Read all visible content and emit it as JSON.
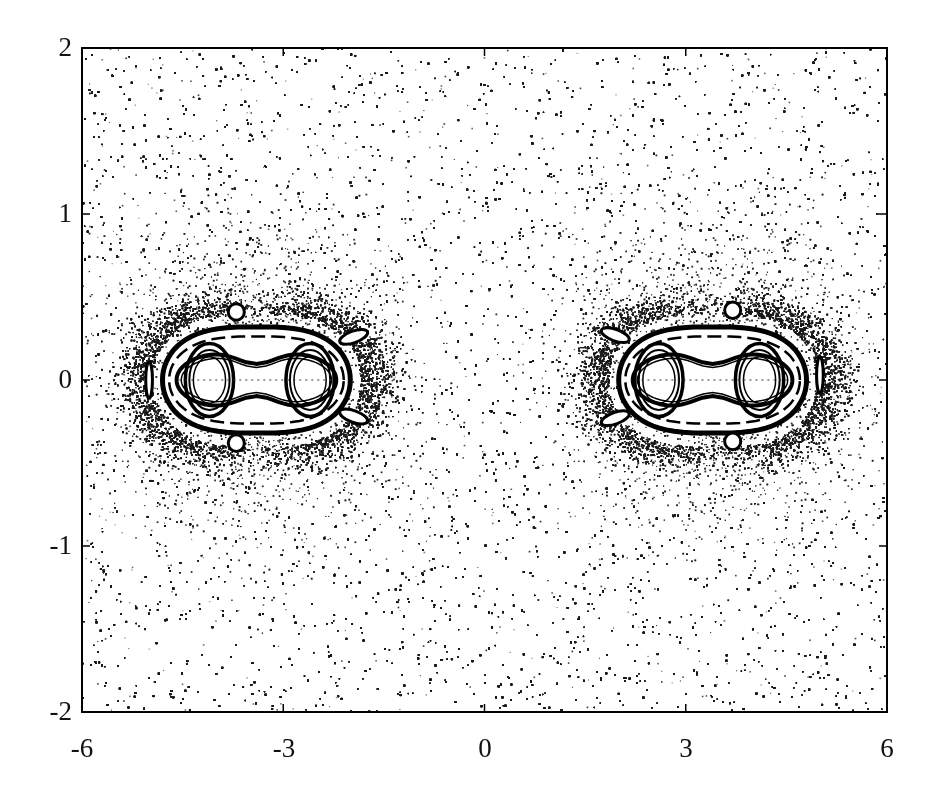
{
  "chart_data": {
    "type": "scatter",
    "title": "",
    "xlabel": "",
    "ylabel": "",
    "xlim": [
      -6,
      6
    ],
    "ylim": [
      -2,
      2
    ],
    "grid": false,
    "legend": null,
    "x_ticks": [
      -6,
      -3,
      0,
      3,
      6
    ],
    "y_ticks": [
      -2,
      -1,
      0,
      1,
      2
    ],
    "x_tick_labels": [
      "-6",
      "-3",
      "0",
      "3",
      "6"
    ],
    "y_tick_labels": [
      "-2",
      "-1",
      "0",
      "1",
      "2"
    ],
    "point_color": "#1a1a1a",
    "background_color": "#ffffff",
    "chaotic_sea": {
      "x_range": [
        -6,
        6
      ],
      "y_range": [
        -2,
        2
      ],
      "approx_points": 60000
    },
    "islands": [
      {
        "name": "left-island-chain",
        "center": [
          -3.35,
          0
        ],
        "outer_boundary": {
          "x_range": [
            -4.8,
            -2.0
          ],
          "y_half_height": 0.32
        },
        "primary_centers": [
          [
            -4.1,
            0
          ],
          [
            -2.6,
            0
          ]
        ],
        "satellite_islands": [
          {
            "center": [
              -3.7,
              0.41
            ],
            "rx": 0.12,
            "ry": 0.05
          },
          {
            "center": [
              -3.7,
              -0.38
            ],
            "rx": 0.12,
            "ry": 0.05
          },
          {
            "center": [
              -5.0,
              0.0
            ],
            "rx": 0.05,
            "ry": 0.11
          },
          {
            "center": [
              -1.95,
              0.26
            ],
            "rx": 0.22,
            "ry": 0.035,
            "angle": -20
          },
          {
            "center": [
              -1.95,
              -0.22
            ],
            "rx": 0.22,
            "ry": 0.035,
            "angle": 20
          }
        ]
      },
      {
        "name": "right-island-chain",
        "center": [
          3.35,
          0
        ],
        "outer_boundary": {
          "x_range": [
            2.0,
            4.8
          ],
          "y_half_height": 0.32
        },
        "primary_centers": [
          [
            2.6,
            0
          ],
          [
            4.1,
            0
          ]
        ],
        "satellite_islands": [
          {
            "center": [
              3.7,
              0.42
            ],
            "rx": 0.12,
            "ry": 0.05
          },
          {
            "center": [
              3.7,
              -0.37
            ],
            "rx": 0.12,
            "ry": 0.05
          },
          {
            "center": [
              5.0,
              0.03
            ],
            "rx": 0.05,
            "ry": 0.11
          },
          {
            "center": [
              1.95,
              0.27
            ],
            "rx": 0.22,
            "ry": 0.035,
            "angle": 20
          },
          {
            "center": [
              1.95,
              -0.23
            ],
            "rx": 0.22,
            "ry": 0.035,
            "angle": -20
          }
        ]
      }
    ]
  },
  "axes": {
    "frame": {
      "left_px": 82,
      "top_px": 48,
      "right_px": 887,
      "bottom_px": 712
    }
  }
}
